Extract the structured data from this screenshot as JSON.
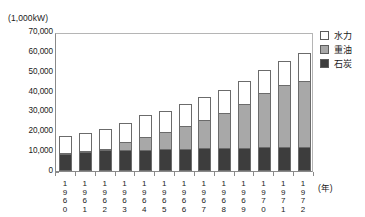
{
  "chart_data": {
    "type": "bar",
    "subtype": "stacked-vertical-bar",
    "title": "",
    "unit_label": "(1,000kW)",
    "xlabel": "(年)",
    "ylabel": "",
    "ylim": [
      0,
      70000
    ],
    "ytick_step": 10000,
    "grid": false,
    "legend_position": "top-right",
    "yticks": [
      {
        "value": 70000,
        "label": "70,000"
      },
      {
        "value": 60000,
        "label": "60,000"
      },
      {
        "value": 50000,
        "label": "50,000"
      },
      {
        "value": 40000,
        "label": "40,000"
      },
      {
        "value": 30000,
        "label": "30,000"
      },
      {
        "value": 20000,
        "label": "20,000"
      },
      {
        "value": 10000,
        "label": "10,000"
      },
      {
        "value": 0,
        "label": "0"
      }
    ],
    "categories": [
      "1960",
      "1961",
      "1962",
      "1963",
      "1964",
      "1965",
      "1966",
      "1967",
      "1968",
      "1969",
      "1970",
      "1971",
      "1972"
    ],
    "category_digits": [
      [
        "1",
        "9",
        "6",
        "0"
      ],
      [
        "1",
        "9",
        "6",
        "1"
      ],
      [
        "1",
        "9",
        "6",
        "2"
      ],
      [
        "1",
        "9",
        "6",
        "3"
      ],
      [
        "1",
        "9",
        "6",
        "4"
      ],
      [
        "1",
        "9",
        "6",
        "5"
      ],
      [
        "1",
        "9",
        "6",
        "6"
      ],
      [
        "1",
        "9",
        "6",
        "7"
      ],
      [
        "1",
        "9",
        "6",
        "8"
      ],
      [
        "1",
        "9",
        "6",
        "9"
      ],
      [
        "1",
        "9",
        "7",
        "0"
      ],
      [
        "1",
        "9",
        "7",
        "1"
      ],
      [
        "1",
        "9",
        "7",
        "2"
      ]
    ],
    "series": [
      {
        "name": "石炭",
        "key": "coal",
        "color": "#3d3d3d",
        "values": [
          8700,
          9600,
          10400,
          10500,
          10700,
          11000,
          11300,
          11400,
          11600,
          11800,
          11900,
          12000,
          12200
        ]
      },
      {
        "name": "重油",
        "key": "oil",
        "color": "#a8a8a8",
        "values": [
          300,
          400,
          700,
          3900,
          6200,
          8700,
          11600,
          14400,
          17600,
          22000,
          27500,
          31500,
          33300
        ]
      },
      {
        "name": "水力",
        "key": "hydro",
        "color": "#ffffff",
        "values": [
          8600,
          9200,
          10000,
          10000,
          11200,
          10500,
          10900,
          11600,
          11400,
          11400,
          11400,
          12000,
          14000
        ]
      }
    ],
    "totals": [
      17600,
      19200,
      21100,
      24400,
      28100,
      30200,
      33800,
      37400,
      40600,
      45200,
      50800,
      55500,
      59500
    ]
  },
  "legend": {
    "items": [
      {
        "label": "水力",
        "swatch": "hydro"
      },
      {
        "label": "重油",
        "swatch": "oil"
      },
      {
        "label": "石炭",
        "swatch": "coal"
      }
    ]
  }
}
